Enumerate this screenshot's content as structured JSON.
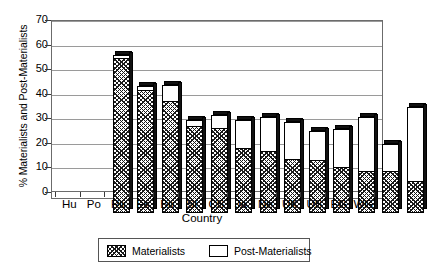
{
  "chart_data": {
    "type": "bar",
    "subtype": "stacked",
    "title": "",
    "xlabel": "Country",
    "ylabel": "% Materialists and Post-Materialists",
    "ylim": [
      0,
      70
    ],
    "ytick_step": 10,
    "yticks": [
      0,
      10,
      20,
      30,
      40,
      50,
      60,
      70
    ],
    "ytick_labels": [
      "0",
      "10",
      "20",
      "30",
      "40",
      "50",
      "60",
      "70"
    ],
    "grid": true,
    "grid_axis": "y",
    "legend_position": "below-center",
    "categories": [
      "Hu",
      "Po",
      "Ru",
      "Es",
      "Bu",
      "Sl",
      "CS",
      "Ja",
      "Ne",
      "UK",
      "US",
      "EG",
      "WG"
    ],
    "series": [
      {
        "name": "Materialists",
        "fill": "hatched",
        "values": [
          62.5,
          49.5,
          45.0,
          35.0,
          34.0,
          26.0,
          25.0,
          21.5,
          21.0,
          18.5,
          16.5,
          16.5,
          12.5
        ]
      },
      {
        "name": "Post-Materialists",
        "fill": "white",
        "values": [
          2.0,
          2.0,
          7.0,
          3.0,
          6.0,
          12.0,
          14.0,
          15.5,
          12.5,
          15.5,
          22.5,
          11.5,
          30.5
        ]
      }
    ],
    "totals": [
      64.5,
      51.5,
      52.0,
      38.0,
      40.0,
      38.0,
      39.0,
      37.0,
      33.5,
      34.0,
      39.0,
      28.0,
      43.0
    ]
  },
  "legend": {
    "entries": [
      {
        "label": "Materialists",
        "swatch": "hatched-swatch"
      },
      {
        "label": "Post-Materialists",
        "swatch": "white-swatch"
      }
    ]
  },
  "colors": {
    "axis": "#6b6b6b",
    "grid": "#9a9a9a",
    "bar_outline": "#000000",
    "materialists_fill": "#1a1a1a",
    "post_materialists_fill": "#ffffff",
    "background": "#ffffff"
  }
}
